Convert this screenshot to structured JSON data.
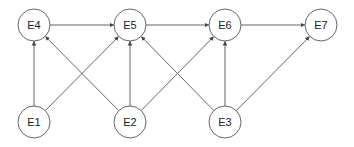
{
  "diagram": {
    "type": "directed-graph",
    "node_radius": 16,
    "stroke_color": "#555555",
    "nodes": [
      {
        "id": "E1",
        "label": "E1",
        "x": 34,
        "y": 122
      },
      {
        "id": "E2",
        "label": "E2",
        "x": 130,
        "y": 122
      },
      {
        "id": "E3",
        "label": "E3",
        "x": 225,
        "y": 122
      },
      {
        "id": "E4",
        "label": "E4",
        "x": 34,
        "y": 25
      },
      {
        "id": "E5",
        "label": "E5",
        "x": 130,
        "y": 25
      },
      {
        "id": "E6",
        "label": "E6",
        "x": 225,
        "y": 25
      },
      {
        "id": "E7",
        "label": "E7",
        "x": 321,
        "y": 25
      }
    ],
    "edges": [
      {
        "from": "E4",
        "to": "E5"
      },
      {
        "from": "E5",
        "to": "E6"
      },
      {
        "from": "E6",
        "to": "E7"
      },
      {
        "from": "E1",
        "to": "E4"
      },
      {
        "from": "E1",
        "to": "E5"
      },
      {
        "from": "E2",
        "to": "E4"
      },
      {
        "from": "E2",
        "to": "E5"
      },
      {
        "from": "E2",
        "to": "E6"
      },
      {
        "from": "E3",
        "to": "E5"
      },
      {
        "from": "E3",
        "to": "E6"
      },
      {
        "from": "E3",
        "to": "E7"
      }
    ]
  }
}
